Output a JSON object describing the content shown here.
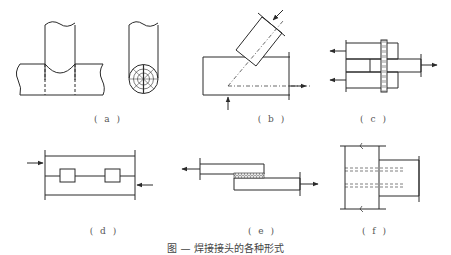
{
  "figure": {
    "panels": [
      {
        "id": "a",
        "label": "( a )",
        "description": "T-joint of round pipes with end view showing weld cross-section"
      },
      {
        "id": "b",
        "label": "( b )",
        "description": "Angled (oblique) bar welded to plate with load arrows"
      },
      {
        "id": "c",
        "label": "( c )",
        "description": "Double lap joint with through connector, tension arrows"
      },
      {
        "id": "d",
        "label": "( d )",
        "description": "Plates joined by blocks, opposing compression arrows"
      },
      {
        "id": "e",
        "label": "( e )",
        "description": "Single lap joint with hatched weld seam, tension arrows"
      },
      {
        "id": "f",
        "label": "( f )",
        "description": "T-connection with dashed hidden lines, break marks"
      }
    ],
    "caption": "图 — 焊接接头的各种形式"
  },
  "colors": {
    "line": "#2a2a2a",
    "background": "#ffffff",
    "label": "#555555"
  }
}
